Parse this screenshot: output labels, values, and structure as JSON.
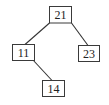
{
  "diagram": {
    "type": "binary-tree",
    "root": "21",
    "nodes": [
      {
        "id": "n21",
        "label": "21"
      },
      {
        "id": "n11",
        "label": "11"
      },
      {
        "id": "n23",
        "label": "23"
      },
      {
        "id": "n14",
        "label": "14"
      }
    ],
    "edges": [
      {
        "from": "n21",
        "to": "n11",
        "relation": "left-child"
      },
      {
        "from": "n21",
        "to": "n23",
        "relation": "right-child"
      },
      {
        "from": "n11",
        "to": "n14",
        "relation": "right-child"
      }
    ]
  }
}
